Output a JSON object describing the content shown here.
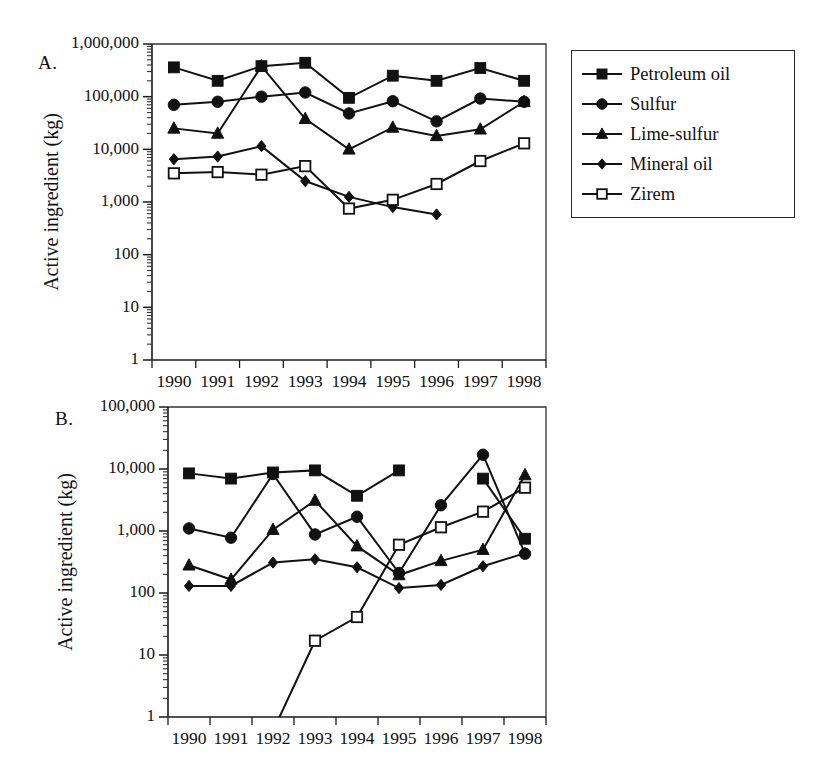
{
  "figure": {
    "panels": [
      {
        "id": "A",
        "letter": "A.",
        "legend_title": "",
        "chart_index": 0
      },
      {
        "id": "B",
        "letter": "B.",
        "legend_title": "",
        "chart_index": 1
      }
    ]
  },
  "chart_data": [
    {
      "type": "line",
      "panel": "A",
      "title": "",
      "xlabel": "",
      "ylabel": "Active ingredient (kg)",
      "x": [
        "1990",
        "1991",
        "1992",
        "1993",
        "1994",
        "1995",
        "1996",
        "1997",
        "1998"
      ],
      "categories": [
        "1990",
        "1991",
        "1992",
        "1993",
        "1994",
        "1995",
        "1996",
        "1997",
        "1998"
      ],
      "yscale": "log",
      "ylim": [
        1,
        1000000
      ],
      "ytick_labels": [
        "1",
        "10",
        "100",
        "1,000",
        "10,000",
        "100,000",
        "1,000,000"
      ],
      "ytick_values": [
        1,
        10,
        100,
        1000,
        10000,
        100000,
        1000000
      ],
      "grid": false,
      "legend_position": "right",
      "series": [
        {
          "name": "Petroleum oil",
          "marker": "filled-square",
          "values": [
            360000,
            200000,
            380000,
            440000,
            95000,
            250000,
            200000,
            350000,
            200000
          ]
        },
        {
          "name": "Sulfur",
          "marker": "filled-circle",
          "values": [
            70000,
            80000,
            100000,
            120000,
            48000,
            82000,
            34000,
            92000,
            80000
          ]
        },
        {
          "name": "Lime-sulfur",
          "marker": "filled-triangle",
          "values": [
            25000,
            20000,
            380000,
            38000,
            10000,
            26000,
            18000,
            24000,
            80000
          ]
        },
        {
          "name": "Mineral oil",
          "marker": "filled-diamond",
          "values": [
            6500,
            7300,
            11500,
            2500,
            1250,
            800,
            580,
            null,
            1
          ]
        },
        {
          "name": "Zirem",
          "marker": "open-square",
          "values": [
            3500,
            3700,
            3300,
            4800,
            750,
            1100,
            2200,
            6000,
            13000
          ]
        }
      ]
    },
    {
      "type": "line",
      "panel": "B",
      "title": "",
      "xlabel": "",
      "ylabel": "Active ingredient (kg)",
      "x": [
        "1990",
        "1991",
        "1992",
        "1993",
        "1994",
        "1995",
        "1996",
        "1997",
        "1998"
      ],
      "categories": [
        "1990",
        "1991",
        "1992",
        "1993",
        "1994",
        "1995",
        "1996",
        "1997",
        "1998"
      ],
      "yscale": "log",
      "ylim": [
        1,
        100000
      ],
      "ytick_labels": [
        "1",
        "10",
        "100",
        "1,000",
        "10,000",
        "100,000"
      ],
      "ytick_values": [
        1,
        10,
        100,
        1000,
        10000,
        100000
      ],
      "grid": false,
      "legend_position": "right",
      "series": [
        {
          "name": "Azinphos-methyl",
          "marker": "filled-square",
          "values": [
            8500,
            7000,
            8800,
            9500,
            3700,
            9500,
            null,
            7000,
            750
          ]
        },
        {
          "name": "Methyl bromide",
          "marker": "filled-circle",
          "values": [
            1100,
            780,
            8300,
            880,
            1700,
            210,
            2600,
            17000,
            430
          ]
        },
        {
          "name": "Phosmet",
          "marker": "filled-triangle",
          "values": [
            280,
            165,
            1050,
            3100,
            570,
            195,
            330,
            500,
            8000
          ]
        },
        {
          "name": "Chlorpyrifos",
          "marker": "filled-diamond",
          "values": [
            130,
            130,
            310,
            350,
            260,
            120,
            135,
            270,
            440
          ]
        },
        {
          "name": "Methyl parathion",
          "marker": "open-square",
          "values": [
            null,
            null,
            1,
            17,
            41,
            600,
            1150,
            2050,
            5000
          ]
        }
      ]
    }
  ],
  "legends": [
    {
      "panel": "A",
      "items": [
        {
          "label": "Petroleum oil",
          "marker": "filled-square"
        },
        {
          "label": "Sulfur",
          "marker": "filled-circle"
        },
        {
          "label": "Lime-sulfur",
          "marker": "filled-triangle"
        },
        {
          "label": "Mineral oil",
          "marker": "filled-diamond"
        },
        {
          "label": "Zirem",
          "marker": "open-square"
        }
      ]
    },
    {
      "panel": "B",
      "items": [
        {
          "label": "Azinphos-methyl",
          "marker": "filled-square"
        },
        {
          "label": "Methyl bromide",
          "marker": "filled-circle"
        },
        {
          "label": "Phosmet",
          "marker": "filled-triangle"
        },
        {
          "label": "Chlorpyrifos",
          "marker": "filled-diamond"
        },
        {
          "label": "Methyl parathion",
          "marker": "open-square"
        }
      ]
    }
  ],
  "colors": {
    "ink": "#111111",
    "frame": "#333333",
    "background": "#ffffff"
  }
}
